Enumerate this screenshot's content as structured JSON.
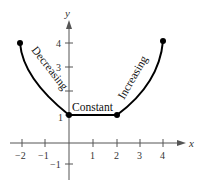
{
  "figure": {
    "x_axis_label": "x",
    "y_axis_label": "y",
    "x_ticks": [
      {
        "value": -2,
        "label": "−2",
        "px": 22
      },
      {
        "value": -1,
        "label": "−1",
        "px": 45
      },
      {
        "value": 1,
        "label": "1",
        "px": 93
      },
      {
        "value": 2,
        "label": "2",
        "px": 117
      },
      {
        "value": 3,
        "label": "3",
        "px": 140
      },
      {
        "value": 4,
        "label": "4",
        "px": 163
      }
    ],
    "y_ticks": [
      {
        "value": 4,
        "label": "4",
        "py": 43
      },
      {
        "value": 3,
        "label": "3",
        "py": 67
      },
      {
        "value": 2,
        "label": "",
        "py": 91
      },
      {
        "value": 1,
        "label": "1",
        "py": 115
      },
      {
        "value": -1,
        "label": "−1",
        "py": 164
      }
    ],
    "segments": [
      {
        "name": "decreasing",
        "label": "Decreasing"
      },
      {
        "name": "constant",
        "label": "Constant"
      },
      {
        "name": "increasing",
        "label": "Increasing"
      }
    ],
    "points": [
      {
        "x": -2,
        "y": 4
      },
      {
        "x": 0,
        "y": 1
      },
      {
        "x": 2,
        "y": 1
      },
      {
        "x": 4,
        "y": 4
      }
    ],
    "colors": {
      "axis": "#555555",
      "curve": "#000000"
    }
  }
}
